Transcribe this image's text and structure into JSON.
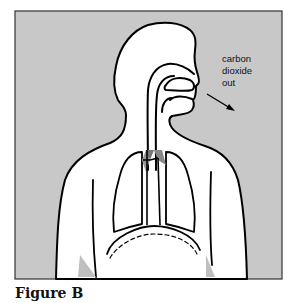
{
  "figure": {
    "label_lines": [
      "carbon",
      "dioxide",
      "out"
    ],
    "caption": "Figure B",
    "colors": {
      "background": "#c8c8c8",
      "frame": "#333333",
      "outline": "#000000",
      "body_fill": "#ffffff"
    }
  }
}
